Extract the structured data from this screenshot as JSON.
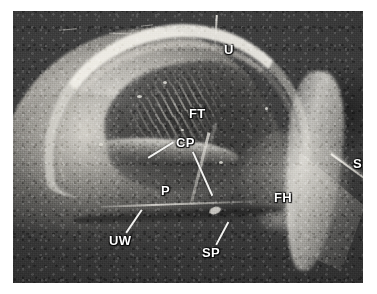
{
  "figure": {
    "kind": "grayscale-micrograph",
    "page_background": "#ffffff",
    "plate_background": "#3a3a3a",
    "label_color": "#ffffff",
    "leader_color": "#f2f2f0",
    "labels": [
      {
        "id": "U",
        "text": "U",
        "x": 211,
        "y": 32,
        "meaning": "uterus"
      },
      {
        "id": "FT",
        "text": "FT",
        "x": 176,
        "y": 96,
        "meaning": "fetal tissue"
      },
      {
        "id": "CP",
        "text": "CP",
        "x": 163,
        "y": 125,
        "meaning": "chorionic plate"
      },
      {
        "id": "P",
        "text": "P",
        "x": 148,
        "y": 173,
        "meaning": "placenta"
      },
      {
        "id": "UW",
        "text": "UW",
        "x": 96,
        "y": 223,
        "meaning": "uterine wall"
      },
      {
        "id": "SP",
        "text": "SP",
        "x": 189,
        "y": 235,
        "meaning": "septum"
      },
      {
        "id": "FH",
        "text": "FH",
        "x": 261,
        "y": 180,
        "meaning": "fetal head"
      },
      {
        "id": "S",
        "text": "S",
        "x": 340,
        "y": 146,
        "meaning": "suture"
      }
    ],
    "leaders": [
      {
        "for": "CP",
        "x": 135,
        "y": 146,
        "length": 30,
        "angle": -32
      },
      {
        "for": "CP",
        "x": 180,
        "y": 140,
        "length": 48,
        "angle": 66
      },
      {
        "for": "UW",
        "x": 113,
        "y": 221,
        "length": 28,
        "angle": -56
      },
      {
        "for": "SP",
        "x": 203,
        "y": 233,
        "length": 26,
        "angle": -62
      },
      {
        "for": "U",
        "x": 202,
        "y": 4,
        "length": 30,
        "angle": 87
      }
    ]
  }
}
